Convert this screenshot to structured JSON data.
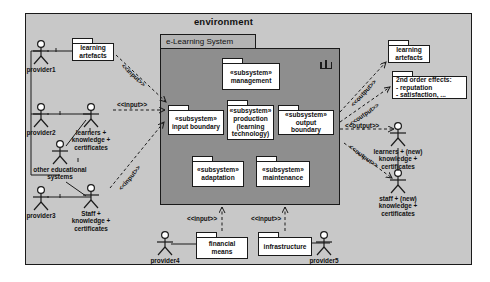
{
  "diagram": {
    "environment_label": "environment",
    "system_label": "e-Learning System"
  },
  "system": {
    "subsystems": [
      {
        "id": "management",
        "stereotype": "«subsystem»",
        "name": "management",
        "name2": "",
        "name3": ""
      },
      {
        "id": "input-boundary",
        "stereotype": "«subsystem»",
        "name": "input boundary",
        "name2": "",
        "name3": ""
      },
      {
        "id": "production",
        "stereotype": "«subsystem»",
        "name": "production",
        "name2": "(learning",
        "name3": "technology)"
      },
      {
        "id": "output-boundary",
        "stereotype": "«subsystem»",
        "name": "output boundary",
        "name2": "",
        "name3": ""
      },
      {
        "id": "adaptation",
        "stereotype": "«subsystem»",
        "name": "adaptation",
        "name2": "",
        "name3": ""
      },
      {
        "id": "maintenance",
        "stereotype": "«subsystem»",
        "name": "maintenance",
        "name2": "",
        "name3": ""
      }
    ]
  },
  "actors": {
    "provider1": {
      "label": "provider1"
    },
    "provider2": {
      "label": "provider2"
    },
    "provider3": {
      "label": "provider3"
    },
    "provider4": {
      "label": "provider4"
    },
    "provider5": {
      "label": "provider5"
    },
    "learners_in": {
      "line1": "learners +",
      "line2": "knowledge +",
      "line3": "certificates"
    },
    "other_edu": {
      "line1": "other educational",
      "line2": "systems",
      "line3": ""
    },
    "staff_in": {
      "line1": "Staff +",
      "line2": "knowledge +",
      "line3": "certificates"
    },
    "learners_out": {
      "line1": "learners + (new)",
      "line2": "knowledge +",
      "line3": "certificates"
    },
    "staff_out": {
      "line1": "staff + (new)",
      "line2": "knowledge +",
      "line3": "certificates"
    }
  },
  "artifacts": {
    "learning_artefacts_left": {
      "line1": "learning",
      "line2": "artefacts"
    },
    "learning_artefacts_right": {
      "line1": "learning",
      "line2": "artefacts"
    },
    "financial_means": {
      "line1": "financial",
      "line2": "means"
    },
    "infrastructure": {
      "line1": "infrastructure",
      "line2": ""
    },
    "second_order_effects": {
      "line1": "2nd order effects:",
      "line2": "- reputation",
      "line3": "- satisfaction, ..."
    }
  },
  "edges": {
    "input_artefacts": {
      "label": "<<input>>"
    },
    "input_learners": {
      "label": "<<input>>"
    },
    "input_staff": {
      "label": "<<input>>"
    },
    "input_financial": {
      "label": "<<input>>"
    },
    "input_infrastructure": {
      "label": "<<input>>"
    },
    "output_artefacts": {
      "label": "<<output>>"
    },
    "output_effects": {
      "label": "<<output>>"
    },
    "output_learners": {
      "label": "<<output>>"
    },
    "output_staff": {
      "label": "<<output>>"
    }
  },
  "colors": {
    "environment_fill": "#c8c8c8",
    "system_fill": "#8e8e8e",
    "system_tab_fill": "#b4b4b4",
    "node_fill": "#ffffff",
    "stroke": "#1a1a1a"
  }
}
